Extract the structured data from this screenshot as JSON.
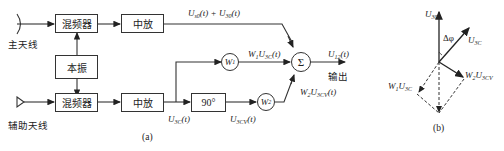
{
  "diagram_a": {
    "caption": "(a)",
    "main_antenna_label": "主天线",
    "aux_antenna_label": "辅助天线",
    "mixer_top": "混频器",
    "mixer_bottom": "混频器",
    "if_amp_top": "中放",
    "if_amp_bottom": "中放",
    "local_osc": "本振",
    "phase_shift": "90°",
    "w1": "W",
    "w1_sub": "1",
    "w2": "W",
    "w2_sub": "2",
    "sum_symbol": "Σ",
    "output_label": "输出",
    "signals": {
      "main_sig": {
        "a": "U",
        "a_sub": "s0",
        "mid": "(t) + U",
        "b_sub": "30",
        "end": "(t)"
      },
      "w1_out": {
        "pre": "W",
        "pre_sub": "1",
        "u": "U",
        "u_sub": "3C",
        "end": "(t)"
      },
      "out": {
        "u": "U",
        "u_sub": "12",
        "end": "(t)"
      },
      "aux_if": {
        "u": "U",
        "u_sub": "3C",
        "end": "(t)"
      },
      "aux_shift": {
        "u": "U",
        "u_sub": "3CV",
        "end": "(t)"
      },
      "w2_out": {
        "pre": "W",
        "pre_sub": "2",
        "u": "U",
        "u_sub": "3CV",
        "end": "(t)"
      }
    }
  },
  "diagram_b": {
    "caption": "(b)",
    "vec_main": {
      "u": "U",
      "u_sub": "30"
    },
    "vec_aux": {
      "u": "U",
      "u_sub": "3C"
    },
    "angle": "Δφ",
    "vec_w1": {
      "pre": "W",
      "pre_sub": "1",
      "u": "U",
      "u_sub": "3C"
    },
    "vec_w2": {
      "pre": "W",
      "pre_sub": "2",
      "u": "U",
      "u_sub": "3CV"
    }
  }
}
